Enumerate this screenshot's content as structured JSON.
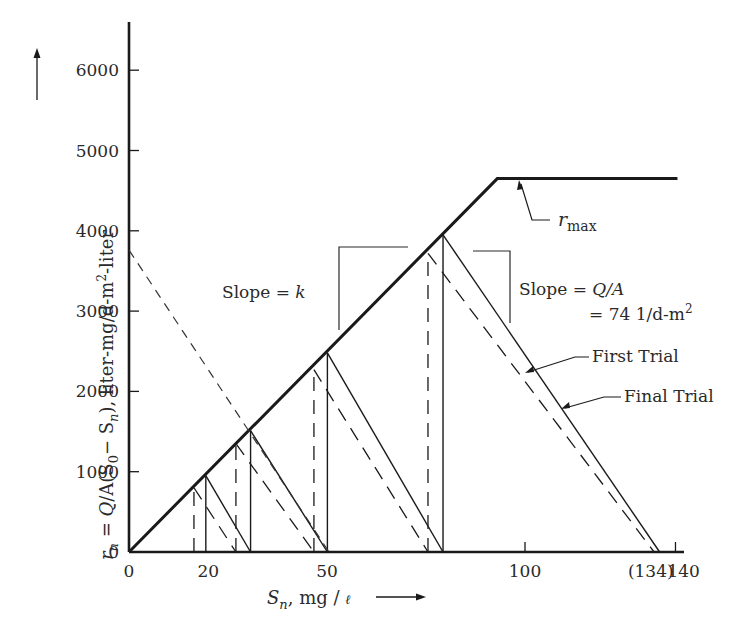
{
  "chart_data": {
    "type": "line",
    "title": "",
    "xlabel": "S_n, mg/ℓ",
    "ylabel": "r_n = Q/A(S_0 − S_n), liter-mg/d-m²-liter",
    "xlim": [
      0,
      140
    ],
    "ylim": [
      0,
      6500
    ],
    "grid": false,
    "x_ticks": [
      {
        "value": 0,
        "label": "0"
      },
      {
        "value": 20,
        "label": "20"
      },
      {
        "value": 50,
        "label": "50"
      },
      {
        "value": 100,
        "label": "100"
      },
      {
        "value": 134,
        "label": "(134)"
      },
      {
        "value": 138,
        "label": "140"
      }
    ],
    "y_ticks": [
      {
        "value": 0,
        "label": "0"
      },
      {
        "value": 1000,
        "label": "1000"
      },
      {
        "value": 2000,
        "label": "2000"
      },
      {
        "value": 3000,
        "label": "3000"
      },
      {
        "value": 4000,
        "label": "4000"
      },
      {
        "value": 5000,
        "label": "5000"
      },
      {
        "value": 6000,
        "label": "6000"
      }
    ],
    "series": [
      {
        "name": "Rate curve (slope = k, capped at r_max)",
        "style": "solid-thick",
        "points": [
          [
            0,
            0
          ],
          [
            93,
            4650
          ],
          [
            138.5,
            4650
          ]
        ]
      },
      {
        "name": "First Trial",
        "style": "solid",
        "stages": [
          {
            "S": 19.4,
            "r": 950,
            "S_next": 30.7
          },
          {
            "S": 30.7,
            "r": 1510,
            "S_next": 50.1
          },
          {
            "S": 50.1,
            "r": 2480,
            "S_next": 79.3
          },
          {
            "S": 79.3,
            "r": 3950,
            "S_next": 134
          }
        ]
      },
      {
        "name": "Final Trial",
        "style": "dashed",
        "stages": [
          {
            "S": 16.4,
            "r": 800,
            "S_next": 27.0
          },
          {
            "S": 27.0,
            "r": 1350,
            "S_next": 46.7
          },
          {
            "S": 46.7,
            "r": 2270,
            "S_next": 75.5
          },
          {
            "S": 75.5,
            "r": 3720,
            "S_next": 132.6
          }
        ]
      },
      {
        "name": "Operating line (slope = -Q/A)",
        "style": "dashed-light",
        "points": [
          [
            0,
            3760
          ],
          [
            50.5,
            0
          ]
        ]
      }
    ],
    "annotations": [
      {
        "text": "Slope = k",
        "x": 24,
        "y": 3000
      },
      {
        "text": "Slope = Q/A",
        "x": 98,
        "y": 3000
      },
      {
        "text": "= 74 1/d-m²",
        "x": 105,
        "y": 2600
      },
      {
        "text": "First Trial",
        "x": 108,
        "y": 2180
      },
      {
        "text": "Final Trial",
        "x": 116,
        "y": 1890
      },
      {
        "text": "r_max",
        "x": 101,
        "y": 4200
      }
    ]
  },
  "labels": {
    "ylabel_prefix": "r",
    "ylabel_sub_n": "n",
    "ylabel_eq": " =  ",
    "ylabel_Q": "Q",
    "ylabel_mid": "/A(S",
    "ylabel_sub_0": "0",
    "ylabel_minus": "− S",
    "ylabel_sub_n2": "n",
    "ylabel_tail": "),  liter-mg/d-m",
    "ylabel_sup": "2",
    "ylabel_end": "-liter",
    "xlabel_S": "S",
    "xlabel_sub": "n",
    "xlabel_rest": ", mg / ",
    "xlabel_ell": "ℓ",
    "slope_k_text": "Slope = ",
    "slope_k_var": "k",
    "slope_qa_text": "Slope  = ",
    "slope_qa_Q": "Q",
    "slope_qa_A": "/A",
    "slope_qa_line2": "= 74 1/d-m",
    "slope_qa_sup": "2",
    "first_trial": "First Trial",
    "final_trial": "Final Trial",
    "rmax_r": "r",
    "rmax_sub": "max"
  },
  "colors": {
    "ink": "#1a1a1a",
    "text": "#2a2a2a",
    "background": "#ffffff"
  }
}
